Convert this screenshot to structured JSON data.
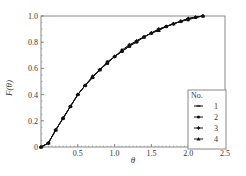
{
  "chart_data": {
    "type": "line",
    "title": "",
    "xlabel": "θ",
    "ylabel": "F(θ)",
    "xlim": [
      0,
      2.5
    ],
    "ylim": [
      0,
      1.0
    ],
    "x_ticks": [
      "0.5",
      "1.0",
      "1.5",
      "2.0",
      "2.5"
    ],
    "y_ticks": [
      "0",
      "0.2",
      "0.4",
      "0.6",
      "0.8",
      "1.0"
    ],
    "grid": false,
    "legend": {
      "title": "No.",
      "position": "lower right",
      "entries": [
        "1",
        "2",
        "3",
        "4"
      ]
    },
    "x": [
      0,
      0.1,
      0.2,
      0.3,
      0.4,
      0.5,
      0.6,
      0.7,
      0.8,
      0.9,
      1.0,
      1.1,
      1.2,
      1.3,
      1.4,
      1.5,
      1.6,
      1.7,
      1.8,
      1.9,
      2.0,
      2.1,
      2.2
    ],
    "series": [
      {
        "name": "1",
        "marker": "dash",
        "values": [
          0,
          0.03,
          0.13,
          0.22,
          0.31,
          0.4,
          0.47,
          0.53,
          0.59,
          0.64,
          0.69,
          0.73,
          0.77,
          0.81,
          0.84,
          0.87,
          0.9,
          0.92,
          0.94,
          0.96,
          0.98,
          0.99,
          1.0
        ]
      },
      {
        "name": "2",
        "marker": "circle",
        "values": [
          0,
          0.03,
          0.13,
          0.22,
          0.31,
          0.4,
          0.47,
          0.53,
          0.59,
          0.64,
          0.69,
          0.73,
          0.77,
          0.8,
          0.84,
          0.87,
          0.89,
          0.92,
          0.94,
          0.96,
          0.97,
          0.99,
          1.0
        ]
      },
      {
        "name": "3",
        "marker": "diamond",
        "values": [
          0,
          0.03,
          0.13,
          0.22,
          0.31,
          0.4,
          0.47,
          0.54,
          0.59,
          0.65,
          0.69,
          0.74,
          0.78,
          0.81,
          0.84,
          0.87,
          0.9,
          0.92,
          0.94,
          0.96,
          0.98,
          0.99,
          1.0
        ]
      },
      {
        "name": "4",
        "marker": "triangle",
        "values": [
          0,
          0.03,
          0.13,
          0.22,
          0.31,
          0.4,
          0.47,
          0.53,
          0.59,
          0.64,
          0.69,
          0.73,
          0.77,
          0.81,
          0.84,
          0.87,
          0.89,
          0.92,
          0.94,
          0.96,
          0.98,
          0.99,
          1.0
        ]
      }
    ]
  },
  "colors": {
    "axis": "#888888",
    "line": "#111111",
    "text": "#333333"
  }
}
